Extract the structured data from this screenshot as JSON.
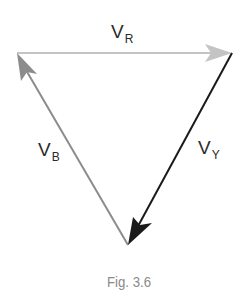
{
  "figure": {
    "caption": "Fig. 3.6",
    "vectors": [
      {
        "name": "V_R",
        "symbol": "V",
        "subscript": "R",
        "color": "#c4c4c4",
        "from": [
          17,
          53
        ],
        "to": [
          232,
          53
        ]
      },
      {
        "name": "V_Y",
        "symbol": "V",
        "subscript": "Y",
        "color": "#1a1a1a",
        "from": [
          232,
          53
        ],
        "to": [
          128,
          245
        ]
      },
      {
        "name": "V_B",
        "symbol": "V",
        "subscript": "B",
        "color": "#8c8c8c",
        "from": [
          128,
          245
        ],
        "to": [
          17,
          53
        ]
      }
    ]
  }
}
